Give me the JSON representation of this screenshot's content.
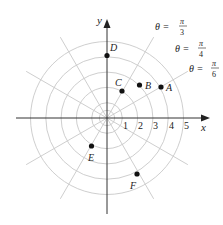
{
  "diagram": {
    "type": "polar-grid",
    "origin_px": [
      107,
      118
    ],
    "unit_px": 15.3,
    "rings": [
      1,
      2,
      3,
      4,
      5
    ],
    "radial_step": "pi/6",
    "axes": {
      "x_label": "x",
      "y_label": "y"
    },
    "ticks": [
      "1",
      "2",
      "3",
      "4",
      "5"
    ],
    "angle_labels": [
      {
        "theta": "θ = ",
        "num": "π",
        "den": "3"
      },
      {
        "theta": "θ = ",
        "num": "π",
        "den": "4"
      },
      {
        "theta": "θ = ",
        "num": "π",
        "den": "6"
      }
    ],
    "points": [
      {
        "name": "A",
        "r": 4,
        "theta": "π/6"
      },
      {
        "name": "B",
        "r": 3,
        "theta": "π/4"
      },
      {
        "name": "C",
        "r": 2,
        "theta": "π/3"
      },
      {
        "name": "D",
        "r": 4,
        "theta": "π/2"
      },
      {
        "name": "E",
        "r": 2,
        "theta": "4π/3"
      },
      {
        "name": "F",
        "r": 4,
        "theta": "5π/3"
      }
    ],
    "colors": {
      "grid": "#c8c8c8",
      "axis": "#333333",
      "point": "#111111"
    }
  }
}
